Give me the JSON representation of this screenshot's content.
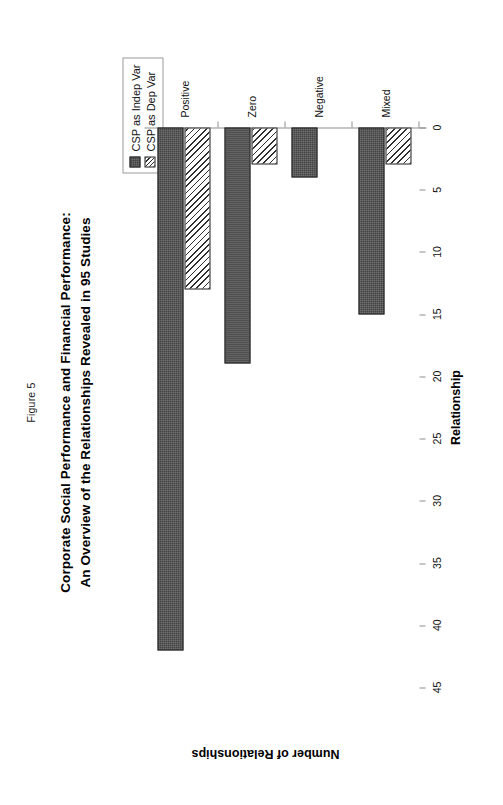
{
  "figure": {
    "number_label": "Figure 5",
    "title_line1": "Corporate Social Performance and Financial Performance:",
    "title_line2": "An Overview of the Relationships Revealed in 95 Studies"
  },
  "legend": {
    "position": "top-right",
    "items": [
      {
        "label": "CSP as Indep Var",
        "pattern": "solid-dark",
        "color": "#6e6e6e"
      },
      {
        "label": "CSP as Dep Var",
        "pattern": "diagonal-hatch",
        "color": "#ffffff"
      }
    ]
  },
  "axes": {
    "x_title": "Relationship",
    "y_title": "Number of Relationships",
    "y_ticks": [
      0,
      5,
      10,
      15,
      20,
      25,
      30,
      35,
      40,
      45
    ],
    "y_min": 0,
    "y_max": 45
  },
  "chart_data": {
    "type": "bar",
    "orientation": "horizontal-rotated",
    "title": "Corporate Social Performance and Financial Performance: An Overview of the Relationships Revealed in 95 Studies",
    "subtitle": "Figure 5",
    "xlabel": "Relationship",
    "ylabel": "Number of Relationships",
    "ylim": [
      0,
      45
    ],
    "yticks": [
      0,
      5,
      10,
      15,
      20,
      25,
      30,
      35,
      40,
      45
    ],
    "grid": false,
    "legend_position": "top right",
    "categories": [
      "Positive",
      "Zero",
      "Negative",
      "Mixed"
    ],
    "series": [
      {
        "name": "CSP as Indep Var",
        "values": [
          42,
          19,
          4,
          15
        ]
      },
      {
        "name": "CSP as Dep Var",
        "values": [
          13,
          3,
          0,
          3
        ]
      }
    ]
  }
}
